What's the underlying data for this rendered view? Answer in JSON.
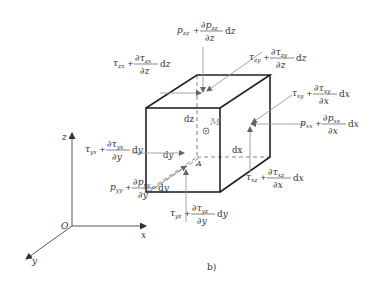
{
  "figure": {
    "caption": "b)"
  },
  "axes": {
    "origin": "O",
    "x": "x",
    "y": "y",
    "z": "z"
  },
  "element": {
    "point_M": "M",
    "point_A": "A",
    "dx": "dx",
    "dy": "dy",
    "dz": "dz"
  },
  "stresses": [
    {
      "id": "p_zz",
      "base": "p",
      "sub": "zz",
      "num_sym": "p",
      "num_sub": "zz",
      "den": "z",
      "diff": "dz"
    },
    {
      "id": "tau_zx",
      "base": "τ",
      "sub": "zx",
      "num_sym": "τ",
      "num_sub": "zx",
      "den": "z",
      "diff": "dz"
    },
    {
      "id": "tau_zy",
      "base": "τ",
      "sub": "zy",
      "num_sym": "τ",
      "num_sub": "zy",
      "den": "z",
      "diff": "dz"
    },
    {
      "id": "tau_xy",
      "base": "τ",
      "sub": "xy",
      "num_sym": "τ",
      "num_sub": "xy",
      "den": "x",
      "diff": "dx"
    },
    {
      "id": "p_xx",
      "base": "p",
      "sub": "xx",
      "num_sym": "p",
      "num_sub": "xx",
      "den": "x",
      "diff": "dx"
    },
    {
      "id": "tau_xz",
      "base": "τ",
      "sub": "xz",
      "num_sym": "τ",
      "num_sub": "xz",
      "den": "x",
      "diff": "dx"
    },
    {
      "id": "tau_yx",
      "base": "τ",
      "sub": "yx",
      "num_sym": "τ",
      "num_sub": "yx",
      "den": "y",
      "diff": "dy"
    },
    {
      "id": "p_yy",
      "base": "p",
      "sub": "yy",
      "num_sym": "p",
      "num_sub": "yy",
      "den": "y",
      "diff": "dy"
    },
    {
      "id": "tau_yz",
      "base": "τ",
      "sub": "yz",
      "num_sym": "τ",
      "num_sub": "yz",
      "den": "y",
      "diff": "dy"
    }
  ],
  "symbols": {
    "plus": "+",
    "partial": "∂"
  }
}
